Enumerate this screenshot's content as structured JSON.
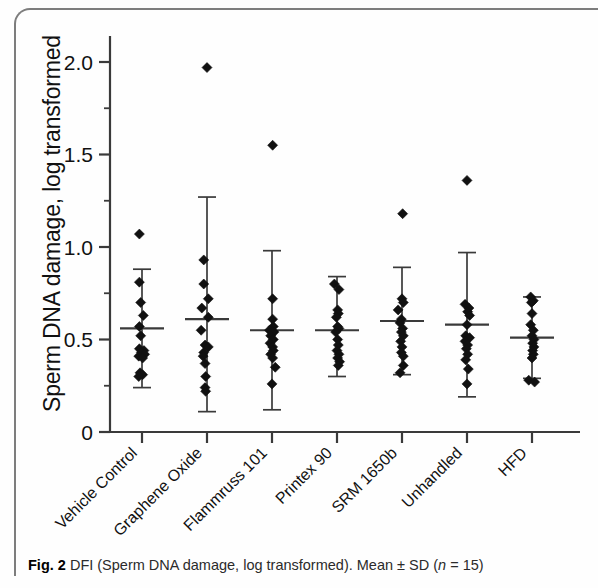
{
  "figure": {
    "caption_label": "Fig. 2",
    "caption_text_a": "DFI (Sperm DNA damage, log transformed). Mean ",
    "caption_pm": "± ",
    "caption_text_b": "SD (",
    "caption_italic_n": "n",
    "caption_text_c": " = 15)"
  },
  "chart_data": {
    "type": "scatter",
    "title": "",
    "subtitle": "",
    "xlabel": "",
    "ylabel": "Sperm DNA damage, log transformed",
    "ylim": [
      0,
      2.25
    ],
    "yticks": [
      0,
      0.5,
      1.0,
      1.5,
      2.0
    ],
    "ytick_labels": [
      "0",
      "0.5",
      "1.0",
      "1.5",
      "2.0"
    ],
    "yminor_ticks": [
      0.25,
      0.75,
      1.25,
      1.75,
      2.25
    ],
    "grid": false,
    "legend": "none",
    "n_per_group": 15,
    "error_bar_type": "SD",
    "marker": "diamond",
    "categories": [
      "Vehicle Control",
      "Graphene Oxide",
      "Flammruss 101",
      "Printex 90",
      "SRM 1650b",
      "Unhandled",
      "HFD"
    ],
    "series": [
      {
        "name": "Vehicle Control",
        "mean": 0.56,
        "sd": 0.32,
        "error_low": 0.24,
        "error_high": 0.88,
        "points": [
          {
            "value": 1.07,
            "offset": -0.04
          },
          {
            "value": 0.81,
            "offset": -0.04
          },
          {
            "value": 0.7,
            "offset": -0.02
          },
          {
            "value": 0.63,
            "offset": 0.02
          },
          {
            "value": 0.57,
            "offset": -0.04
          },
          {
            "value": 0.52,
            "offset": -0.02
          },
          {
            "value": 0.45,
            "offset": -0.04
          },
          {
            "value": 0.44,
            "offset": 0.03
          },
          {
            "value": 0.43,
            "offset": -0.01
          },
          {
            "value": 0.42,
            "offset": 0.04
          },
          {
            "value": 0.41,
            "offset": -0.05
          },
          {
            "value": 0.4,
            "offset": 0.01
          },
          {
            "value": 0.32,
            "offset": -0.03
          },
          {
            "value": 0.31,
            "offset": 0.01
          },
          {
            "value": 0.3,
            "offset": -0.05
          }
        ]
      },
      {
        "name": "Graphene Oxide",
        "mean": 0.61,
        "sd": 0.51,
        "error_low": 0.11,
        "error_high": 1.27,
        "points": [
          {
            "value": 1.97,
            "offset": 0.0
          },
          {
            "value": 0.93,
            "offset": -0.05
          },
          {
            "value": 0.8,
            "offset": -0.05
          },
          {
            "value": 0.72,
            "offset": 0.02
          },
          {
            "value": 0.67,
            "offset": -0.08
          },
          {
            "value": 0.62,
            "offset": 0.02
          },
          {
            "value": 0.55,
            "offset": -0.09
          },
          {
            "value": 0.47,
            "offset": -0.03
          },
          {
            "value": 0.46,
            "offset": 0.02
          },
          {
            "value": 0.43,
            "offset": -0.05
          },
          {
            "value": 0.41,
            "offset": -0.06
          },
          {
            "value": 0.37,
            "offset": -0.03
          },
          {
            "value": 0.3,
            "offset": -0.02
          },
          {
            "value": 0.24,
            "offset": -0.03
          },
          {
            "value": 0.22,
            "offset": -0.02
          }
        ]
      },
      {
        "name": "Flammruss 101",
        "mean": 0.55,
        "sd": 0.43,
        "error_low": 0.12,
        "error_high": 0.98,
        "points": [
          {
            "value": 1.55,
            "offset": 0.01
          },
          {
            "value": 0.72,
            "offset": 0.01
          },
          {
            "value": 0.61,
            "offset": 0.01
          },
          {
            "value": 0.57,
            "offset": 0.02
          },
          {
            "value": 0.55,
            "offset": -0.04
          },
          {
            "value": 0.54,
            "offset": 0.03
          },
          {
            "value": 0.52,
            "offset": -0.02
          },
          {
            "value": 0.5,
            "offset": 0.02
          },
          {
            "value": 0.48,
            "offset": -0.03
          },
          {
            "value": 0.46,
            "offset": 0.01
          },
          {
            "value": 0.44,
            "offset": 0.02
          },
          {
            "value": 0.42,
            "offset": -0.02
          },
          {
            "value": 0.4,
            "offset": 0.01
          },
          {
            "value": 0.35,
            "offset": 0.05
          },
          {
            "value": 0.26,
            "offset": 0.0
          }
        ]
      },
      {
        "name": "Printex 90",
        "mean": 0.55,
        "sd": 0.29,
        "error_low": 0.3,
        "error_high": 0.84,
        "points": [
          {
            "value": 0.8,
            "offset": -0.04
          },
          {
            "value": 0.77,
            "offset": 0.03
          },
          {
            "value": 0.66,
            "offset": 0.01
          },
          {
            "value": 0.64,
            "offset": 0.02
          },
          {
            "value": 0.62,
            "offset": -0.01
          },
          {
            "value": 0.57,
            "offset": 0.01
          },
          {
            "value": 0.56,
            "offset": 0.03
          },
          {
            "value": 0.54,
            "offset": -0.02
          },
          {
            "value": 0.5,
            "offset": 0.01
          },
          {
            "value": 0.47,
            "offset": 0.02
          },
          {
            "value": 0.44,
            "offset": 0.0
          },
          {
            "value": 0.42,
            "offset": 0.03
          },
          {
            "value": 0.4,
            "offset": 0.01
          },
          {
            "value": 0.38,
            "offset": 0.04
          },
          {
            "value": 0.36,
            "offset": 0.02
          }
        ]
      },
      {
        "name": "SRM 1650b",
        "mean": 0.6,
        "sd": 0.29,
        "error_low": 0.31,
        "error_high": 0.89,
        "points": [
          {
            "value": 1.18,
            "offset": 0.01
          },
          {
            "value": 0.72,
            "offset": 0.0
          },
          {
            "value": 0.7,
            "offset": 0.02
          },
          {
            "value": 0.66,
            "offset": -0.06
          },
          {
            "value": 0.61,
            "offset": -0.01
          },
          {
            "value": 0.59,
            "offset": -0.03
          },
          {
            "value": 0.56,
            "offset": 0.01
          },
          {
            "value": 0.54,
            "offset": -0.01
          },
          {
            "value": 0.52,
            "offset": 0.02
          },
          {
            "value": 0.49,
            "offset": -0.02
          },
          {
            "value": 0.46,
            "offset": 0.0
          },
          {
            "value": 0.43,
            "offset": -0.01
          },
          {
            "value": 0.41,
            "offset": 0.02
          },
          {
            "value": 0.36,
            "offset": 0.02
          },
          {
            "value": 0.32,
            "offset": -0.03
          }
        ]
      },
      {
        "name": "Unhandled",
        "mean": 0.58,
        "sd": 0.39,
        "error_low": 0.19,
        "error_high": 0.97,
        "points": [
          {
            "value": 1.36,
            "offset": 0.0
          },
          {
            "value": 0.69,
            "offset": -0.03
          },
          {
            "value": 0.67,
            "offset": 0.03
          },
          {
            "value": 0.65,
            "offset": 0.01
          },
          {
            "value": 0.63,
            "offset": 0.04
          },
          {
            "value": 0.58,
            "offset": 0.0
          },
          {
            "value": 0.52,
            "offset": -0.02
          },
          {
            "value": 0.51,
            "offset": 0.04
          },
          {
            "value": 0.49,
            "offset": -0.03
          },
          {
            "value": 0.47,
            "offset": 0.01
          },
          {
            "value": 0.45,
            "offset": -0.01
          },
          {
            "value": 0.42,
            "offset": 0.01
          },
          {
            "value": 0.39,
            "offset": -0.02
          },
          {
            "value": 0.34,
            "offset": 0.02
          },
          {
            "value": 0.26,
            "offset": 0.0
          }
        ]
      },
      {
        "name": "HFD",
        "mean": 0.51,
        "sd": 0.22,
        "error_low": 0.29,
        "error_high": 0.73,
        "points": [
          {
            "value": 0.73,
            "offset": -0.02
          },
          {
            "value": 0.71,
            "offset": 0.02
          },
          {
            "value": 0.7,
            "offset": -0.01
          },
          {
            "value": 0.64,
            "offset": 0.0
          },
          {
            "value": 0.58,
            "offset": -0.02
          },
          {
            "value": 0.55,
            "offset": 0.02
          },
          {
            "value": 0.52,
            "offset": 0.0
          },
          {
            "value": 0.5,
            "offset": 0.03
          },
          {
            "value": 0.48,
            "offset": 0.01
          },
          {
            "value": 0.46,
            "offset": 0.03
          },
          {
            "value": 0.44,
            "offset": 0.01
          },
          {
            "value": 0.42,
            "offset": 0.02
          },
          {
            "value": 0.4,
            "offset": 0.0
          },
          {
            "value": 0.28,
            "offset": -0.05
          },
          {
            "value": 0.27,
            "offset": 0.04
          }
        ]
      }
    ]
  }
}
